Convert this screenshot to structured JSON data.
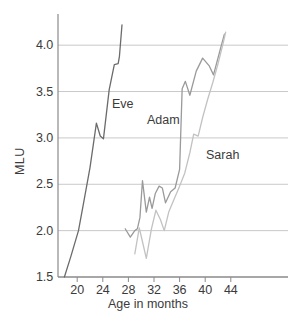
{
  "chart_data": {
    "type": "line",
    "title": "",
    "xlabel": "Age in months",
    "ylabel": "MLU",
    "xlim": [
      17,
      47
    ],
    "ylim": [
      1.5,
      4.25
    ],
    "xticks": [
      20,
      24,
      28,
      32,
      36,
      40,
      44
    ],
    "yticks": [
      "1.5",
      "2.0",
      "2.5",
      "3.0",
      "3.5",
      "4.0"
    ],
    "grid": "horizontal",
    "legend": "inline-series-labels",
    "series": [
      {
        "name": "Eve",
        "color": "#6b6b6b",
        "points": [
          [
            18.0,
            1.5
          ],
          [
            19.0,
            1.72
          ],
          [
            20.2,
            2.0
          ],
          [
            21.0,
            2.3
          ],
          [
            22.0,
            2.68
          ],
          [
            23.0,
            3.16
          ],
          [
            23.6,
            3.02
          ],
          [
            24.1,
            2.99
          ],
          [
            25.0,
            3.52
          ],
          [
            25.8,
            3.79
          ],
          [
            26.4,
            3.8
          ],
          [
            26.6,
            3.88
          ],
          [
            27.0,
            4.22
          ]
        ]
      },
      {
        "name": "Adam",
        "color": "#9a9a9a",
        "points": [
          [
            27.5,
            2.02
          ],
          [
            28.3,
            1.93
          ],
          [
            29.0,
            2.0
          ],
          [
            29.4,
            2.02
          ],
          [
            29.8,
            2.14
          ],
          [
            30.2,
            2.54
          ],
          [
            30.8,
            2.2
          ],
          [
            31.3,
            2.36
          ],
          [
            31.7,
            2.24
          ],
          [
            32.2,
            2.4
          ],
          [
            32.8,
            2.48
          ],
          [
            33.3,
            2.46
          ],
          [
            33.8,
            2.3
          ],
          [
            34.6,
            2.42
          ],
          [
            35.3,
            2.46
          ],
          [
            36.0,
            2.66
          ],
          [
            36.4,
            3.53
          ],
          [
            36.9,
            3.61
          ],
          [
            37.6,
            3.46
          ],
          [
            38.6,
            3.72
          ],
          [
            39.6,
            3.86
          ],
          [
            40.6,
            3.78
          ],
          [
            41.3,
            3.68
          ],
          [
            42.3,
            3.94
          ],
          [
            43.0,
            4.12
          ]
        ]
      },
      {
        "name": "Sarah",
        "color": "#c2c2c2",
        "points": [
          [
            29.0,
            1.75
          ],
          [
            29.7,
            2.03
          ],
          [
            30.2,
            1.88
          ],
          [
            30.8,
            1.7
          ],
          [
            31.6,
            2.02
          ],
          [
            32.3,
            2.22
          ],
          [
            33.0,
            2.12
          ],
          [
            33.6,
            2.0
          ],
          [
            34.3,
            2.2
          ],
          [
            35.2,
            2.35
          ],
          [
            36.0,
            2.48
          ],
          [
            36.8,
            2.62
          ],
          [
            37.6,
            2.84
          ],
          [
            38.2,
            3.04
          ],
          [
            38.9,
            3.02
          ],
          [
            39.6,
            3.22
          ],
          [
            40.4,
            3.42
          ],
          [
            41.2,
            3.6
          ],
          [
            42.0,
            3.8
          ],
          [
            42.8,
            4.02
          ],
          [
            43.2,
            4.14
          ]
        ]
      }
    ]
  },
  "axes": {
    "y_title": "MLU",
    "x_title": "Age in months",
    "y_tick_labels": [
      "4.0",
      "3.5",
      "3.0",
      "2.5",
      "2.0",
      "1.5"
    ],
    "x_tick_labels": [
      "20",
      "24",
      "28",
      "32",
      "36",
      "40",
      "44"
    ]
  },
  "series_labels": {
    "eve": "Eve",
    "adam": "Adam",
    "sarah": "Sarah"
  },
  "colors": {
    "eve": "#6b6b6b",
    "adam": "#9a9a9a",
    "sarah": "#c2c2c2",
    "axis": "#8a8a8a",
    "grid": "#c9c9c9",
    "text": "#3b3b3b"
  }
}
